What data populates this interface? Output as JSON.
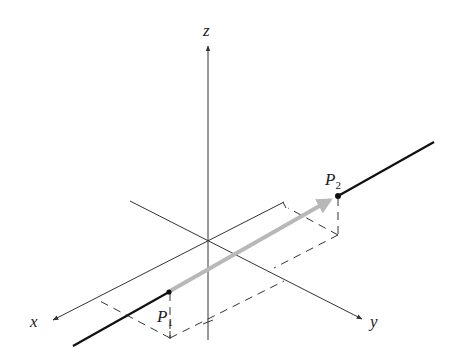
{
  "figure": {
    "type": "3d-coordinate-diagram",
    "axes": {
      "x": {
        "label": "x"
      },
      "y": {
        "label": "y"
      },
      "z": {
        "label": "z"
      }
    },
    "points": [
      {
        "id": "P1",
        "base": "P",
        "subscript": "1"
      },
      {
        "id": "P2",
        "base": "P",
        "subscript": "2"
      }
    ],
    "vector": {
      "from": "P1",
      "to": "P2",
      "color": "#b8b8b8"
    },
    "line_color": "#111111",
    "axis_color": "#333333",
    "dash_color": "#333333"
  }
}
